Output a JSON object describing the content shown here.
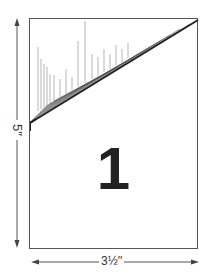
{
  "diagram": {
    "card": {
      "number_label": "1",
      "border_color": "#555555"
    },
    "dimensions": {
      "height_label": "5′′",
      "width_label": "3½′′"
    }
  }
}
